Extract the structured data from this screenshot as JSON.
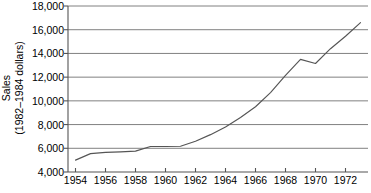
{
  "chart_data": {
    "type": "line",
    "title": "",
    "xlabel": "",
    "ylabel_line1": "Sales",
    "ylabel_line2": "(1982–1984 dollars)",
    "xlim": [
      1953.5,
      1973.5
    ],
    "ylim": [
      4000,
      18000
    ],
    "grid": true,
    "legend": "none",
    "y_ticks": [
      {
        "value": 18000,
        "label": "18,000"
      },
      {
        "value": 16000,
        "label": "16,000"
      },
      {
        "value": 14000,
        "label": "14,000"
      },
      {
        "value": 12000,
        "label": "12,000"
      },
      {
        "value": 10000,
        "label": "10,000"
      },
      {
        "value": 8000,
        "label": "8,000"
      },
      {
        "value": 6000,
        "label": "6,000"
      },
      {
        "value": 4000,
        "label": "4,000"
      }
    ],
    "x_ticks": [
      {
        "value": 1954,
        "label": "1954"
      },
      {
        "value": 1956,
        "label": "1956"
      },
      {
        "value": 1958,
        "label": "1958"
      },
      {
        "value": 1960,
        "label": "1960"
      },
      {
        "value": 1962,
        "label": "1962"
      },
      {
        "value": 1964,
        "label": "1964"
      },
      {
        "value": 1966,
        "label": "1966"
      },
      {
        "value": 1968,
        "label": "1968"
      },
      {
        "value": 1970,
        "label": "1970"
      },
      {
        "value": 1972,
        "label": "1972"
      }
    ],
    "series": [
      {
        "name": "Sales",
        "color": "#555555",
        "x": [
          1954,
          1955,
          1956,
          1957,
          1958,
          1959,
          1960,
          1961,
          1962,
          1963,
          1964,
          1965,
          1966,
          1967,
          1968,
          1969,
          1970,
          1971,
          1972,
          1973
        ],
        "values": [
          5000,
          5550,
          5650,
          5700,
          5760,
          6150,
          6150,
          6170,
          6600,
          7150,
          7800,
          8600,
          9500,
          10700,
          12150,
          13500,
          13150,
          14400,
          15450,
          16600
        ]
      }
    ],
    "colors": {
      "gridline": "#808080",
      "axis": "#555555",
      "line": "#555555",
      "background": "#ffffff",
      "text": "#000000"
    }
  }
}
